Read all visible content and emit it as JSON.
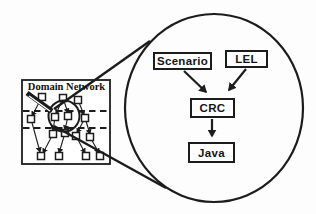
{
  "colors": {
    "ink": "#1c1c1c",
    "paper": "#ffffff"
  },
  "domain_box": {
    "label": "Domain Network"
  },
  "zoom_view": {
    "boxes": [
      {
        "label": "Scenario"
      },
      {
        "label": "LEL"
      },
      {
        "label": "CRC"
      },
      {
        "label": "Java"
      }
    ],
    "relations": [
      {
        "from": "Scenario",
        "to": "CRC"
      },
      {
        "from": "LEL",
        "to": "CRC"
      },
      {
        "from": "CRC",
        "to": "Java"
      }
    ]
  }
}
